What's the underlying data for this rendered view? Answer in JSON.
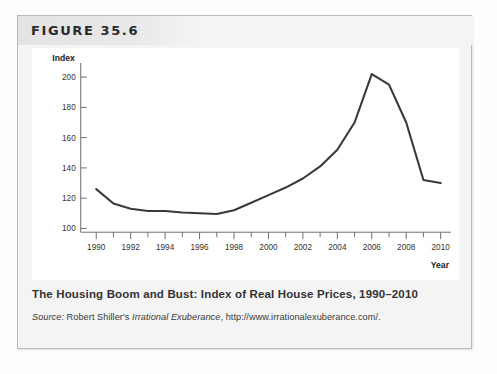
{
  "figure": {
    "label": "FIGURE 35.6",
    "caption": "The Housing Boom and Bust: Index of Real House Prices, 1990–2010",
    "source": {
      "prefix": "Source:",
      "author": " Robert Shiller's ",
      "book": "Irrational Exuberance",
      "suffix": ", http://www.irrationalexuberance.com/."
    }
  },
  "chart_data": {
    "type": "line",
    "title": "The Housing Boom and Bust: Index of Real House Prices, 1990–2010",
    "xlabel": "Year",
    "ylabel": "Index",
    "xlim": [
      1989,
      2010.6
    ],
    "ylim": [
      95,
      208
    ],
    "grid": false,
    "legend": "none",
    "line_color": "#3a3a3a",
    "x_ticks_all": [
      1990,
      1991,
      1992,
      1993,
      1994,
      1995,
      1996,
      1997,
      1998,
      1999,
      2000,
      2001,
      2002,
      2003,
      2004,
      2005,
      2006,
      2007,
      2008,
      2009,
      2010
    ],
    "x_tick_labels": [
      "1990",
      "1992",
      "1994",
      "1996",
      "1998",
      "2000",
      "2002",
      "2004",
      "2006",
      "2008",
      "2010"
    ],
    "x_tick_label_values": [
      1990,
      1992,
      1994,
      1996,
      1998,
      2000,
      2002,
      2004,
      2006,
      2008,
      2010
    ],
    "y_ticks": [
      100,
      120,
      140,
      160,
      180,
      200
    ],
    "y_tick_labels": [
      "100",
      "120",
      "140",
      "160",
      "180",
      "200"
    ],
    "series": [
      {
        "name": "Index of Real House Prices",
        "x": [
          1990,
          1991,
          1992,
          1993,
          1994,
          1995,
          1996,
          1997,
          1998,
          1999,
          2000,
          2001,
          2002,
          2003,
          2004,
          2005,
          2006,
          2007,
          2008,
          2009,
          2010
        ],
        "values": [
          126,
          116.5,
          113,
          111.5,
          111.5,
          110.5,
          110,
          109.5,
          112,
          117,
          122,
          127,
          133,
          141,
          152,
          170,
          202,
          195,
          170,
          132,
          130
        ]
      }
    ]
  }
}
